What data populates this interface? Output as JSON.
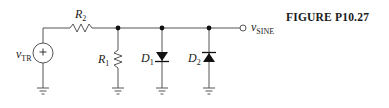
{
  "figure": {
    "caption": "FIGURE P10.27"
  },
  "circuit": {
    "source": {
      "symbol": "v",
      "subscript": "TR",
      "polarity": "+"
    },
    "output": {
      "symbol": "v",
      "subscript": "SINE"
    },
    "components": [
      {
        "id": "R2",
        "type": "resistor",
        "symbol": "R",
        "subscript": "2",
        "orientation": "horizontal",
        "placement": "series"
      },
      {
        "id": "R1",
        "type": "resistor",
        "symbol": "R",
        "subscript": "1",
        "orientation": "vertical",
        "placement": "shunt-to-ground"
      },
      {
        "id": "D1",
        "type": "diode",
        "symbol": "D",
        "subscript": "1",
        "direction": "anode-top (points down to ground)",
        "placement": "shunt-to-ground"
      },
      {
        "id": "D2",
        "type": "diode",
        "symbol": "D",
        "subscript": "2",
        "direction": "anode-bottom (points up to node)",
        "placement": "shunt-to-ground"
      }
    ],
    "grounds": 4,
    "junction_nodes": 3
  },
  "colors": {
    "wire": "#555555",
    "text": "#222222",
    "background": "#ffffff"
  }
}
